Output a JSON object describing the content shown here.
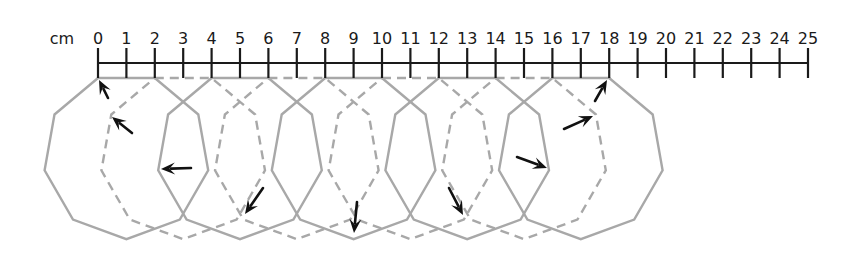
{
  "diagram": {
    "unit_label": "cm",
    "ruler": {
      "min": 0,
      "max": 25,
      "step": 1,
      "ticks": [
        "0",
        "1",
        "2",
        "3",
        "4",
        "5",
        "6",
        "7",
        "8",
        "9",
        "10",
        "11",
        "12",
        "13",
        "14",
        "15",
        "16",
        "17",
        "18",
        "19",
        "20",
        "21",
        "22",
        "23",
        "24",
        "25"
      ]
    },
    "polygon": {
      "sides": 9,
      "side_length_cm": 2,
      "positions": [
        {
          "start_cm": 0,
          "style": "solid"
        },
        {
          "start_cm": 2,
          "style": "dashed"
        },
        {
          "start_cm": 4,
          "style": "solid"
        },
        {
          "start_cm": 6,
          "style": "dashed"
        },
        {
          "start_cm": 8,
          "style": "solid"
        },
        {
          "start_cm": 10,
          "style": "dashed"
        },
        {
          "start_cm": 12,
          "style": "solid"
        },
        {
          "start_cm": 14,
          "style": "dashed"
        },
        {
          "start_cm": 16,
          "style": "solid"
        }
      ]
    },
    "arrows": [
      {
        "from": [
          108,
          98
        ],
        "to": [
          99,
          80
        ]
      },
      {
        "from": [
          132,
          133
        ],
        "to": [
          112,
          117
        ]
      },
      {
        "from": [
          191,
          168
        ],
        "to": [
          161,
          169
        ]
      },
      {
        "from": [
          263,
          188
        ],
        "to": [
          245,
          214
        ]
      },
      {
        "from": [
          357,
          202
        ],
        "to": [
          354,
          233
        ]
      },
      {
        "from": [
          449,
          188
        ],
        "to": [
          463,
          215
        ]
      },
      {
        "from": [
          517,
          157
        ],
        "to": [
          547,
          168
        ]
      },
      {
        "from": [
          564,
          129
        ],
        "to": [
          593,
          116
        ]
      },
      {
        "from": [
          595,
          101
        ],
        "to": [
          607,
          80
        ]
      }
    ],
    "colors": {
      "ruler": "#1a1a1a",
      "polygon": "#a8a8a8",
      "arrow": "#111111"
    }
  }
}
